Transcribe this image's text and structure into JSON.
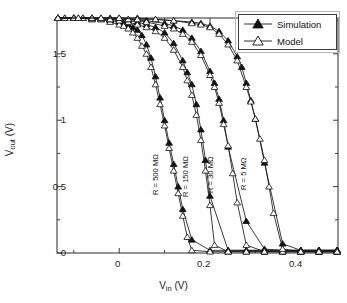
{
  "chart_data": {
    "type": "line",
    "title": "",
    "xlabel": "V_in (V)",
    "ylabel": "V_out (V)",
    "xlabel_parts": {
      "main": "V",
      "sub": "in",
      "unit": " (V)"
    },
    "ylabel_parts": {
      "main": "V",
      "sub": "out",
      "unit": " (V)"
    },
    "xlim": [
      -0.137,
      0.482
    ],
    "ylim": [
      0.0,
      1.77
    ],
    "xticks_major": [
      0,
      0.2,
      0.4
    ],
    "xticks_major_labels": [
      "0",
      "0.2",
      "0.4"
    ],
    "xticks_minor": [
      -0.1,
      0.1,
      0.3
    ],
    "yticks_major": [
      0,
      0.5,
      1,
      1.5
    ],
    "yticks_major_labels": [
      "0",
      "0.5",
      "1",
      "1.5"
    ],
    "yticks_minor": [
      0.25,
      0.75,
      1.25,
      1.75
    ],
    "grid": false,
    "legend_position": "top-right",
    "legend": [
      {
        "name": "Simulation",
        "marker": "filled-triangle"
      },
      {
        "name": "Model",
        "marker": "open-triangle"
      }
    ],
    "annotations": [
      {
        "text": "R = 500 MΩ",
        "rotation": -90,
        "x_px": 152,
        "y_px": 195
      },
      {
        "text": "R = 150 MΩ",
        "rotation": -90,
        "x_px": 182,
        "y_px": 197
      },
      {
        "text": "R = 30 MΩ",
        "rotation": -90,
        "x_px": 207,
        "y_px": 193
      },
      {
        "text": "R = 5 MΩ",
        "rotation": -90,
        "x_px": 240,
        "y_px": 190
      }
    ],
    "series": [
      {
        "name": "R = 500 MΩ Simulation",
        "resistance": "500 MΩ",
        "kind": "simulation",
        "marker": "filled-triangle",
        "x": [
          -0.135,
          -0.12,
          -0.1,
          -0.08,
          -0.06,
          -0.04,
          -0.02,
          0.0,
          0.01,
          0.02,
          0.03,
          0.04,
          0.05,
          0.06,
          0.07,
          0.08,
          0.09,
          0.1,
          0.11,
          0.12,
          0.13,
          0.14,
          0.16,
          0.2,
          0.24,
          0.28,
          0.32,
          0.36,
          0.4,
          0.44,
          0.48
        ],
        "y": [
          1.77,
          1.77,
          1.77,
          1.77,
          1.76,
          1.76,
          1.75,
          1.74,
          1.73,
          1.72,
          1.7,
          1.68,
          1.64,
          1.57,
          1.47,
          1.33,
          1.17,
          1.0,
          0.83,
          0.67,
          0.5,
          0.33,
          0.1,
          0.02,
          0.02,
          0.02,
          0.02,
          0.02,
          0.02,
          0.02,
          0.02
        ]
      },
      {
        "name": "R = 500 MΩ Model",
        "resistance": "500 MΩ",
        "kind": "model",
        "marker": "open-triangle",
        "x": [
          -0.135,
          -0.12,
          -0.1,
          -0.08,
          -0.06,
          -0.04,
          -0.02,
          0.0,
          0.01,
          0.02,
          0.03,
          0.04,
          0.05,
          0.06,
          0.07,
          0.08,
          0.09,
          0.1,
          0.11,
          0.12,
          0.13,
          0.14,
          0.15,
          0.16,
          0.2,
          0.24,
          0.28,
          0.32,
          0.36,
          0.4,
          0.44,
          0.48
        ],
        "y": [
          1.77,
          1.77,
          1.77,
          1.77,
          1.76,
          1.76,
          1.74,
          1.72,
          1.71,
          1.69,
          1.66,
          1.62,
          1.56,
          1.5,
          1.4,
          1.27,
          1.12,
          0.96,
          0.79,
          0.62,
          0.45,
          0.28,
          0.12,
          0.02,
          0.01,
          0.01,
          0.01,
          0.01,
          0.01,
          0.01,
          0.01,
          0.01
        ]
      },
      {
        "name": "R = 150 MΩ Simulation",
        "resistance": "150 MΩ",
        "kind": "simulation",
        "marker": "filled-triangle",
        "x": [
          -0.135,
          -0.1,
          -0.06,
          -0.02,
          0.0,
          0.02,
          0.04,
          0.06,
          0.08,
          0.1,
          0.12,
          0.14,
          0.15,
          0.16,
          0.17,
          0.18,
          0.19,
          0.2,
          0.24,
          0.28,
          0.32,
          0.36,
          0.4,
          0.44,
          0.48
        ],
        "y": [
          1.77,
          1.77,
          1.77,
          1.76,
          1.76,
          1.75,
          1.74,
          1.72,
          1.7,
          1.66,
          1.58,
          1.45,
          1.36,
          1.27,
          1.12,
          0.93,
          0.7,
          0.43,
          0.02,
          0.02,
          0.02,
          0.02,
          0.02,
          0.02,
          0.02
        ]
      },
      {
        "name": "R = 150 MΩ Model",
        "resistance": "150 MΩ",
        "kind": "model",
        "marker": "open-triangle",
        "x": [
          -0.135,
          -0.1,
          -0.06,
          -0.02,
          0.0,
          0.02,
          0.04,
          0.06,
          0.08,
          0.1,
          0.12,
          0.14,
          0.15,
          0.16,
          0.17,
          0.18,
          0.19,
          0.2,
          0.21,
          0.24,
          0.28,
          0.32,
          0.36,
          0.4,
          0.44,
          0.48
        ],
        "y": [
          1.77,
          1.77,
          1.77,
          1.76,
          1.75,
          1.74,
          1.72,
          1.7,
          1.67,
          1.62,
          1.53,
          1.4,
          1.3,
          1.19,
          1.04,
          0.85,
          0.62,
          0.36,
          0.06,
          0.01,
          0.01,
          0.01,
          0.01,
          0.01,
          0.01,
          0.01
        ]
      },
      {
        "name": "R = 30 MΩ Simulation",
        "resistance": "30 MΩ",
        "kind": "simulation",
        "marker": "filled-triangle",
        "x": [
          -0.135,
          -0.1,
          -0.06,
          -0.02,
          0.02,
          0.06,
          0.1,
          0.12,
          0.14,
          0.16,
          0.18,
          0.2,
          0.21,
          0.22,
          0.23,
          0.24,
          0.28,
          0.32,
          0.36,
          0.4,
          0.44,
          0.48
        ],
        "y": [
          1.77,
          1.77,
          1.77,
          1.77,
          1.76,
          1.75,
          1.73,
          1.71,
          1.68,
          1.62,
          1.52,
          1.37,
          1.28,
          1.16,
          1.0,
          0.8,
          0.24,
          0.03,
          0.02,
          0.02,
          0.02,
          0.02
        ]
      },
      {
        "name": "R = 30 MΩ Model",
        "resistance": "30 MΩ",
        "kind": "model",
        "marker": "open-triangle",
        "x": [
          -0.135,
          -0.1,
          -0.06,
          -0.02,
          0.02,
          0.06,
          0.1,
          0.12,
          0.14,
          0.16,
          0.18,
          0.2,
          0.21,
          0.22,
          0.23,
          0.24,
          0.25,
          0.26,
          0.28,
          0.32,
          0.36,
          0.4,
          0.44,
          0.48
        ],
        "y": [
          1.77,
          1.77,
          1.77,
          1.76,
          1.76,
          1.74,
          1.71,
          1.69,
          1.65,
          1.59,
          1.49,
          1.34,
          1.25,
          1.13,
          0.97,
          0.81,
          0.6,
          0.38,
          0.06,
          0.01,
          0.01,
          0.01,
          0.01,
          0.01
        ]
      },
      {
        "name": "R = 5 MΩ Simulation",
        "resistance": "5 MΩ",
        "kind": "simulation",
        "marker": "filled-triangle",
        "x": [
          -0.135,
          -0.09,
          -0.04,
          0.0,
          0.04,
          0.08,
          0.12,
          0.16,
          0.18,
          0.2,
          0.22,
          0.24,
          0.26,
          0.27,
          0.28,
          0.29,
          0.3,
          0.32,
          0.36,
          0.4,
          0.44,
          0.48
        ],
        "y": [
          1.77,
          1.77,
          1.77,
          1.77,
          1.77,
          1.76,
          1.75,
          1.74,
          1.73,
          1.71,
          1.67,
          1.6,
          1.48,
          1.4,
          1.28,
          1.15,
          1.01,
          0.68,
          0.07,
          0.02,
          0.02,
          0.02
        ]
      },
      {
        "name": "R = 5 MΩ Model",
        "resistance": "5 MΩ",
        "kind": "model",
        "marker": "open-triangle",
        "x": [
          -0.135,
          -0.09,
          -0.04,
          0.0,
          0.04,
          0.08,
          0.12,
          0.16,
          0.18,
          0.2,
          0.22,
          0.24,
          0.26,
          0.28,
          0.29,
          0.3,
          0.31,
          0.32,
          0.33,
          0.34,
          0.36,
          0.4,
          0.44,
          0.48
        ],
        "y": [
          1.77,
          1.77,
          1.77,
          1.77,
          1.76,
          1.76,
          1.75,
          1.73,
          1.72,
          1.7,
          1.65,
          1.57,
          1.45,
          1.25,
          1.14,
          1.01,
          0.86,
          0.7,
          0.5,
          0.3,
          0.03,
          0.01,
          0.01,
          0.01
        ]
      }
    ]
  },
  "legend": {
    "simulation_label": "Simulation",
    "model_label": "Model"
  },
  "axes": {
    "x_title_main": "V",
    "x_title_sub": "in",
    "x_title_unit": " (V)",
    "y_title_main": "V",
    "y_title_sub": "out",
    "y_title_unit": " (V)",
    "xtick_0": "0",
    "xtick_1": "0.2",
    "xtick_2": "0.4",
    "ytick_0": "0",
    "ytick_1": "0.5",
    "ytick_2": "1",
    "ytick_3": "1.5"
  },
  "annotations": {
    "r500": "R = 500 MΩ",
    "r150": "R = 150 MΩ",
    "r30": "R = 30 MΩ",
    "r5": "R = 5 MΩ"
  },
  "colors": {
    "axis": "#3c3c3c",
    "curve": "#1a1a1a",
    "marker_fill": "#111111",
    "background": "#ffffff"
  }
}
